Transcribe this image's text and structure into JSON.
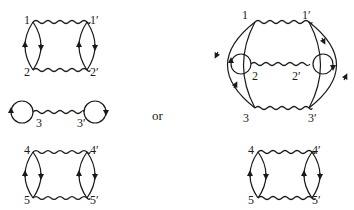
{
  "diagram": {
    "connector_text": "or",
    "left": {
      "top_pair": {
        "v1": "1",
        "v1p": "1′",
        "v2": "2",
        "v2p": "2′"
      },
      "middle": {
        "v3": "3",
        "v3p": "3′"
      },
      "bottom_pair": {
        "v4": "4",
        "v4p": "4′",
        "v5": "5",
        "v5p": "5′"
      }
    },
    "right": {
      "main": {
        "v1": "1",
        "v1p": "1′",
        "v2": "2",
        "v2p": "2′",
        "v3": "3",
        "v3p": "3′"
      },
      "bottom_pair": {
        "v4": "4",
        "v4p": "4′",
        "v5": "5",
        "v5p": "5′"
      }
    },
    "line_color": "#1a1a1a"
  }
}
